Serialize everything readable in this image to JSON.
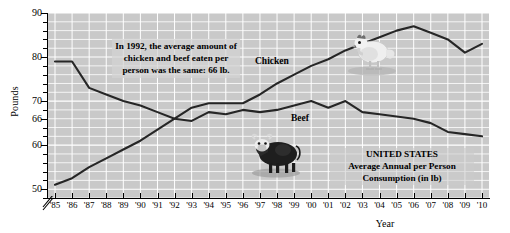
{
  "chart_data": {
    "type": "line",
    "title": "",
    "xlabel": "Year",
    "ylabel": "Pounds",
    "ylim": [
      48,
      90
    ],
    "xlim": [
      "'85",
      "'10"
    ],
    "grid": true,
    "legend_position": "inline-labels",
    "y_ticks": [
      90,
      80,
      70,
      66,
      60,
      50
    ],
    "y_tick_labels": [
      "90",
      "80",
      "70",
      "66",
      "60",
      "50"
    ],
    "y_axis_break": true,
    "categories": [
      "'85",
      "'86",
      "'87",
      "'88",
      "'89",
      "'90",
      "'91",
      "'92",
      "'93",
      "'94",
      "'95",
      "'96",
      "'97",
      "'98",
      "'99",
      "'00",
      "'01",
      "'02",
      "'03",
      "'04",
      "'05",
      "'06",
      "'07",
      "'08",
      "'09",
      "'10"
    ],
    "series": [
      {
        "name": "Beef",
        "values": [
          79,
          79,
          73,
          71.5,
          70,
          69,
          67.5,
          66,
          65.5,
          67.5,
          67,
          68,
          67.5,
          68,
          69,
          70,
          68.5,
          70,
          67.5,
          67,
          66.5,
          66,
          65,
          63,
          62.5,
          62
        ]
      },
      {
        "name": "Chicken",
        "values": [
          51,
          52.5,
          55,
          57,
          59,
          61,
          63.5,
          66,
          68.5,
          69.5,
          69.5,
          69.5,
          71.5,
          74,
          76,
          78,
          79.5,
          81.5,
          83,
          84.5,
          86,
          87,
          85.5,
          84,
          81,
          83
        ]
      }
    ],
    "annotations": [
      {
        "id": "callout-1992",
        "text": "In 1992, the average amount of chicken and beef eaten per person was the same: 66 lb."
      },
      {
        "id": "callout-us",
        "line1": "UNITED STATES",
        "line2": "Average Annual per Person",
        "line3": "Consumption (in lb)"
      }
    ],
    "series_labels": {
      "chicken": "Chicken",
      "beef": "Beef"
    },
    "decorations": [
      {
        "name": "chicken-photo",
        "alt": "chicken"
      },
      {
        "name": "cow-photo",
        "alt": "cow"
      }
    ],
    "colors": {
      "plot_background": "#c9c9c9",
      "gridline": "#ffffff",
      "line": "#262626",
      "axis": "#000000",
      "text": "#000000"
    }
  }
}
